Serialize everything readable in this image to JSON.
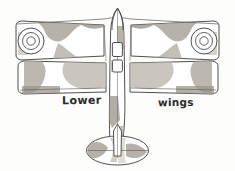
{
  "figure": {
    "kind": "line-drawing",
    "background_color": "#fdfdfc",
    "ink_color": "#3a3a3a",
    "camouflage_dark": "#9a958c",
    "camouflage_mid": "#b8b3aa",
    "camouflage_light": "#d8d4cc"
  },
  "labels": {
    "lower": "Lower",
    "wings": "wings"
  },
  "parts": {
    "upper_wing": "upper-wing",
    "lower_wing": "lower-wing",
    "fuselage": "fuselage",
    "nose": "nose",
    "cockpit_front": "front-cockpit-opening",
    "cockpit_rear": "rear-cockpit-opening",
    "tailplane": "horizontal-stabiliser",
    "fin": "vertical-fin",
    "roundel_left": "left-wingtip-roundel",
    "roundel_right": "right-wingtip-roundel"
  }
}
